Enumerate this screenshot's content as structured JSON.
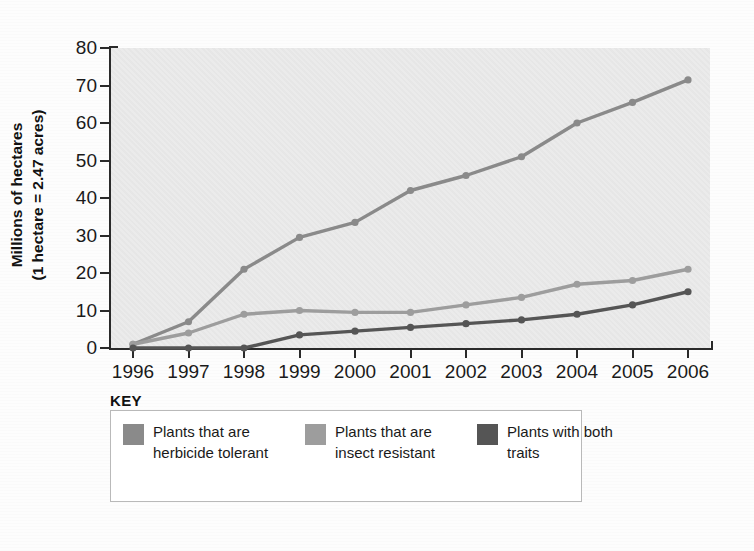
{
  "axis": {
    "y_title_line1": "Millions of hectares",
    "y_title_line2": "(1 hectare = 2.47 acres)",
    "y_ticks": [
      "0",
      "10",
      "20",
      "30",
      "40",
      "50",
      "60",
      "70",
      "80"
    ],
    "x_ticks": [
      "1996",
      "1997",
      "1998",
      "1999",
      "2000",
      "2001",
      "2002",
      "2003",
      "2004",
      "2005",
      "2006"
    ]
  },
  "legend": {
    "title": "KEY",
    "items": [
      {
        "label": "Plants that are herbicide tolerant",
        "color": "#8a8a8a"
      },
      {
        "label": "Plants that are insect resistant",
        "color": "#9d9d9d"
      },
      {
        "label": "Plants with both traits",
        "color": "#555555"
      }
    ]
  },
  "chart_data": {
    "type": "line",
    "title": "",
    "xlabel": "",
    "ylabel": "Millions of hectares (1 hectare = 2.47 acres)",
    "x": [
      1996,
      1997,
      1998,
      1999,
      2000,
      2001,
      2002,
      2003,
      2004,
      2005,
      2006
    ],
    "categories": [
      "1996",
      "1997",
      "1998",
      "1999",
      "2000",
      "2001",
      "2002",
      "2003",
      "2004",
      "2005",
      "2006"
    ],
    "ylim": [
      0,
      80
    ],
    "xlim": [
      1996,
      2006
    ],
    "ytick_step": 10,
    "grid": false,
    "legend_position": "bottom",
    "series": [
      {
        "name": "Plants that are herbicide tolerant",
        "color": "#8a8a8a",
        "values": [
          1,
          7,
          21,
          29.5,
          33.5,
          42,
          46,
          51,
          60,
          65.5,
          71.5
        ]
      },
      {
        "name": "Plants that are insect resistant",
        "color": "#9d9d9d",
        "values": [
          1,
          4,
          9,
          10,
          9.5,
          9.5,
          11.5,
          13.5,
          17,
          18,
          21
        ]
      },
      {
        "name": "Plants with both traits",
        "color": "#555555",
        "values": [
          0,
          0,
          0,
          3.5,
          4.5,
          5.5,
          6.5,
          7.5,
          9,
          11.5,
          15
        ]
      }
    ]
  }
}
